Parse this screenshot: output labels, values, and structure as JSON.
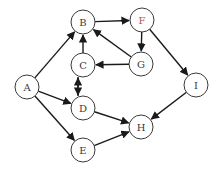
{
  "diagram": {
    "type": "directed-graph",
    "nodes": [
      {
        "id": "A",
        "label": "A",
        "x": 27,
        "y": 87,
        "color": "#3a3a3a"
      },
      {
        "id": "B",
        "label": "B",
        "x": 83,
        "y": 22,
        "color": "#3a3a3a"
      },
      {
        "id": "F",
        "label": "F",
        "x": 142,
        "y": 20,
        "color": "#b5524e"
      },
      {
        "id": "C",
        "label": "C",
        "x": 83,
        "y": 65,
        "color": "#3a3a3a"
      },
      {
        "id": "G",
        "label": "G",
        "x": 141,
        "y": 64,
        "color": "#3a3a3a"
      },
      {
        "id": "D",
        "label": "D",
        "x": 83,
        "y": 108,
        "color": "#3a3a3a"
      },
      {
        "id": "I",
        "label": "I",
        "x": 196,
        "y": 85,
        "color": "#3a3a3a"
      },
      {
        "id": "H",
        "label": "H",
        "x": 141,
        "y": 127,
        "color": "#3a3a3a"
      },
      {
        "id": "E",
        "label": "E",
        "x": 83,
        "y": 150,
        "color": "#3a3a3a"
      }
    ],
    "edges": [
      {
        "from": "A",
        "to": "B"
      },
      {
        "from": "A",
        "to": "D"
      },
      {
        "from": "A",
        "to": "E"
      },
      {
        "from": "B",
        "to": "F"
      },
      {
        "from": "F",
        "to": "G"
      },
      {
        "from": "F",
        "to": "I"
      },
      {
        "from": "G",
        "to": "B"
      },
      {
        "from": "G",
        "to": "C"
      },
      {
        "from": "C",
        "to": "B"
      },
      {
        "from": "C",
        "to": "D",
        "offset": 5
      },
      {
        "from": "D",
        "to": "C",
        "offset": -5
      },
      {
        "from": "D",
        "to": "H"
      },
      {
        "from": "E",
        "to": "H"
      },
      {
        "from": "I",
        "to": "H"
      }
    ],
    "node_radius": 12
  }
}
